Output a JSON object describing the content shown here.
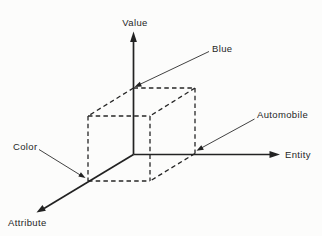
{
  "diagram": {
    "background_color": "#fcfcfb",
    "line_color": "#222222",
    "text_color": "#262626",
    "axes": {
      "vertical": {
        "label": "Value"
      },
      "horizontal": {
        "label": "Entity"
      },
      "diagonal": {
        "label": "Attribute"
      }
    },
    "callouts": {
      "value_example": {
        "label": "Blue"
      },
      "entity_example": {
        "label": "Automobile"
      },
      "attribute_example": {
        "label": "Color"
      }
    }
  }
}
